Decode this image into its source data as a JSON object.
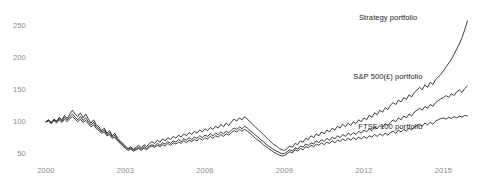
{
  "chart_data": {
    "type": "line",
    "title": "",
    "subtitle": "",
    "xlabel": "",
    "ylabel": "",
    "grid": false,
    "legend_position": "inline-right-of-series",
    "xlim": [
      1999.85,
      2016.0
    ],
    "ylim": [
      40,
      272
    ],
    "yticks": [
      50,
      100,
      150,
      200,
      250
    ],
    "ytick_labels": [
      "50",
      "100",
      "150",
      "200",
      "250"
    ],
    "xticks": [
      2000,
      2003,
      2006,
      2009,
      2012,
      2015
    ],
    "xtick_labels": [
      "2000",
      "2003",
      "2006",
      "2009",
      "2012",
      "2015"
    ],
    "line_color": "#1a1a1a",
    "tick_color": "#8a8a8a",
    "annotations": [
      {
        "name": "strategy-portfolio-label",
        "text": "Strategy portfolio",
        "x": 2014.0,
        "y": 262
      },
      {
        "name": "sp500-portfolio-label",
        "text": "S&P 500(£) portfolio",
        "x": 2014.2,
        "y": 170
      },
      {
        "name": "ftse100-portfolio-label",
        "text": "FTSE 100 portfolio",
        "x": 2014.2,
        "y": 92
      }
    ],
    "series": [
      {
        "name": "Strategy portfolio",
        "label": "Strategy portfolio",
        "final_value": 261,
        "start_value": 100,
        "x": [
          2000.0,
          2000.1,
          2000.2,
          2000.3,
          2000.4,
          2000.5,
          2000.6,
          2000.7,
          2000.8,
          2000.9,
          2001.0,
          2001.1,
          2001.2,
          2001.3,
          2001.4,
          2001.5,
          2001.6,
          2001.7,
          2001.8,
          2001.9,
          2002.0,
          2002.1,
          2002.2,
          2002.3,
          2002.4,
          2002.5,
          2002.6,
          2002.7,
          2002.8,
          2002.9,
          2003.0,
          2003.1,
          2003.2,
          2003.3,
          2003.4,
          2003.5,
          2003.6,
          2003.7,
          2003.8,
          2003.9,
          2004.0,
          2004.1,
          2004.2,
          2004.3,
          2004.4,
          2004.5,
          2004.6,
          2004.7,
          2004.8,
          2004.9,
          2005.0,
          2005.1,
          2005.2,
          2005.3,
          2005.4,
          2005.5,
          2005.6,
          2005.7,
          2005.8,
          2005.9,
          2006.0,
          2006.1,
          2006.2,
          2006.3,
          2006.4,
          2006.5,
          2006.6,
          2006.7,
          2006.8,
          2006.9,
          2007.0,
          2007.1,
          2007.2,
          2007.3,
          2007.4,
          2007.5,
          2007.6,
          2007.7,
          2007.8,
          2007.9,
          2008.0,
          2008.1,
          2008.2,
          2008.3,
          2008.4,
          2008.5,
          2008.6,
          2008.7,
          2008.8,
          2008.9,
          2009.0,
          2009.1,
          2009.2,
          2009.3,
          2009.4,
          2009.5,
          2009.6,
          2009.7,
          2009.8,
          2009.9,
          2010.0,
          2010.1,
          2010.2,
          2010.3,
          2010.4,
          2010.5,
          2010.6,
          2010.7,
          2010.8,
          2010.9,
          2011.0,
          2011.1,
          2011.2,
          2011.3,
          2011.4,
          2011.5,
          2011.6,
          2011.7,
          2011.8,
          2011.9,
          2012.0,
          2012.1,
          2012.2,
          2012.3,
          2012.4,
          2012.5,
          2012.6,
          2012.7,
          2012.8,
          2012.9,
          2013.0,
          2013.1,
          2013.2,
          2013.3,
          2013.4,
          2013.5,
          2013.6,
          2013.7,
          2013.8,
          2013.9,
          2014.0,
          2014.1,
          2014.2,
          2014.3,
          2014.4,
          2014.5,
          2014.6,
          2014.7,
          2014.8,
          2014.9,
          2015.0,
          2015.1,
          2015.2,
          2015.3,
          2015.4,
          2015.5,
          2015.6,
          2015.7,
          2015.8,
          2015.9
        ],
        "values": [
          100,
          103,
          99,
          104,
          101,
          107,
          103,
          110,
          105,
          112,
          118,
          112,
          108,
          114,
          106,
          112,
          104,
          98,
          103,
          95,
          92,
          86,
          90,
          82,
          86,
          78,
          82,
          74,
          70,
          66,
          62,
          58,
          61,
          57,
          60,
          63,
          59,
          64,
          61,
          66,
          69,
          66,
          71,
          68,
          73,
          70,
          75,
          72,
          77,
          74,
          79,
          76,
          81,
          78,
          83,
          80,
          85,
          82,
          87,
          84,
          89,
          86,
          91,
          88,
          93,
          90,
          96,
          92,
          98,
          94,
          100,
          104,
          101,
          106,
          103,
          108,
          104,
          100,
          96,
          92,
          88,
          84,
          80,
          76,
          72,
          68,
          64,
          62,
          58,
          56,
          55,
          58,
          62,
          60,
          66,
          64,
          70,
          68,
          74,
          72,
          78,
          75,
          81,
          78,
          84,
          81,
          87,
          84,
          90,
          87,
          93,
          90,
          96,
          92,
          98,
          94,
          100,
          97,
          103,
          100,
          106,
          103,
          110,
          107,
          114,
          111,
          118,
          115,
          122,
          119,
          126,
          130,
          127,
          134,
          131,
          138,
          135,
          142,
          139,
          146,
          150,
          154,
          150,
          158,
          154,
          162,
          158,
          166,
          170,
          174,
          180,
          186,
          192,
          198,
          206,
          214,
          222,
          232,
          244,
          258
        ]
      },
      {
        "name": "S&P 500(£) portfolio",
        "label": "S&P 500(£) portfolio",
        "final_value": 158,
        "start_value": 100,
        "x": [
          2000.0,
          2000.1,
          2000.2,
          2000.3,
          2000.4,
          2000.5,
          2000.6,
          2000.7,
          2000.8,
          2000.9,
          2001.0,
          2001.1,
          2001.2,
          2001.3,
          2001.4,
          2001.5,
          2001.6,
          2001.7,
          2001.8,
          2001.9,
          2002.0,
          2002.1,
          2002.2,
          2002.3,
          2002.4,
          2002.5,
          2002.6,
          2002.7,
          2002.8,
          2002.9,
          2003.0,
          2003.1,
          2003.2,
          2003.3,
          2003.4,
          2003.5,
          2003.6,
          2003.7,
          2003.8,
          2003.9,
          2004.0,
          2004.1,
          2004.2,
          2004.3,
          2004.4,
          2004.5,
          2004.6,
          2004.7,
          2004.8,
          2004.9,
          2005.0,
          2005.1,
          2005.2,
          2005.3,
          2005.4,
          2005.5,
          2005.6,
          2005.7,
          2005.8,
          2005.9,
          2006.0,
          2006.1,
          2006.2,
          2006.3,
          2006.4,
          2006.5,
          2006.6,
          2006.7,
          2006.8,
          2006.9,
          2007.0,
          2007.1,
          2007.2,
          2007.3,
          2007.4,
          2007.5,
          2007.6,
          2007.7,
          2007.8,
          2007.9,
          2008.0,
          2008.1,
          2008.2,
          2008.3,
          2008.4,
          2008.5,
          2008.6,
          2008.7,
          2008.8,
          2008.9,
          2009.0,
          2009.1,
          2009.2,
          2009.3,
          2009.4,
          2009.5,
          2009.6,
          2009.7,
          2009.8,
          2009.9,
          2010.0,
          2010.1,
          2010.2,
          2010.3,
          2010.4,
          2010.5,
          2010.6,
          2010.7,
          2010.8,
          2010.9,
          2011.0,
          2011.1,
          2011.2,
          2011.3,
          2011.4,
          2011.5,
          2011.6,
          2011.7,
          2011.8,
          2011.9,
          2012.0,
          2012.1,
          2012.2,
          2012.3,
          2012.4,
          2012.5,
          2012.6,
          2012.7,
          2012.8,
          2012.9,
          2013.0,
          2013.1,
          2013.2,
          2013.3,
          2013.4,
          2013.5,
          2013.6,
          2013.7,
          2013.8,
          2013.9,
          2014.0,
          2014.1,
          2014.2,
          2014.3,
          2014.4,
          2014.5,
          2014.6,
          2014.7,
          2014.8,
          2014.9,
          2015.0,
          2015.1,
          2015.2,
          2015.3,
          2015.4,
          2015.5,
          2015.6,
          2015.7,
          2015.8,
          2015.9
        ],
        "values": [
          100,
          102,
          98,
          103,
          100,
          105,
          101,
          107,
          103,
          108,
          112,
          107,
          103,
          108,
          102,
          106,
          100,
          95,
          99,
          92,
          89,
          84,
          87,
          80,
          83,
          76,
          79,
          72,
          68,
          64,
          60,
          57,
          59,
          56,
          58,
          60,
          57,
          61,
          58,
          62,
          64,
          62,
          66,
          63,
          67,
          65,
          69,
          66,
          70,
          68,
          72,
          69,
          73,
          71,
          75,
          72,
          76,
          74,
          78,
          75,
          79,
          77,
          81,
          78,
          82,
          80,
          84,
          81,
          85,
          83,
          87,
          90,
          88,
          92,
          89,
          93,
          90,
          86,
          83,
          79,
          76,
          72,
          69,
          65,
          62,
          59,
          56,
          54,
          52,
          50,
          50,
          53,
          56,
          54,
          59,
          57,
          62,
          60,
          65,
          63,
          67,
          65,
          70,
          67,
          72,
          69,
          74,
          71,
          76,
          73,
          78,
          75,
          80,
          77,
          82,
          79,
          83,
          80,
          85,
          82,
          87,
          84,
          89,
          86,
          92,
          89,
          94,
          91,
          97,
          94,
          99,
          103,
          100,
          106,
          103,
          109,
          106,
          112,
          109,
          115,
          118,
          121,
          118,
          124,
          121,
          127,
          124,
          130,
          133,
          136,
          138,
          141,
          138,
          144,
          141,
          147,
          150,
          146,
          152,
          156
        ]
      },
      {
        "name": "FTSE 100 portfolio",
        "label": "FTSE 100 portfolio",
        "final_value": 110,
        "start_value": 100,
        "x": [
          2000.0,
          2000.1,
          2000.2,
          2000.3,
          2000.4,
          2000.5,
          2000.6,
          2000.7,
          2000.8,
          2000.9,
          2001.0,
          2001.1,
          2001.2,
          2001.3,
          2001.4,
          2001.5,
          2001.6,
          2001.7,
          2001.8,
          2001.9,
          2002.0,
          2002.1,
          2002.2,
          2002.3,
          2002.4,
          2002.5,
          2002.6,
          2002.7,
          2002.8,
          2002.9,
          2003.0,
          2003.1,
          2003.2,
          2003.3,
          2003.4,
          2003.5,
          2003.6,
          2003.7,
          2003.8,
          2003.9,
          2004.0,
          2004.1,
          2004.2,
          2004.3,
          2004.4,
          2004.5,
          2004.6,
          2004.7,
          2004.8,
          2004.9,
          2005.0,
          2005.1,
          2005.2,
          2005.3,
          2005.4,
          2005.5,
          2005.6,
          2005.7,
          2005.8,
          2005.9,
          2006.0,
          2006.1,
          2006.2,
          2006.3,
          2006.4,
          2006.5,
          2006.6,
          2006.7,
          2006.8,
          2006.9,
          2007.0,
          2007.1,
          2007.2,
          2007.3,
          2007.4,
          2007.5,
          2007.6,
          2007.7,
          2007.8,
          2007.9,
          2008.0,
          2008.1,
          2008.2,
          2008.3,
          2008.4,
          2008.5,
          2008.6,
          2008.7,
          2008.8,
          2008.9,
          2009.0,
          2009.1,
          2009.2,
          2009.3,
          2009.4,
          2009.5,
          2009.6,
          2009.7,
          2009.8,
          2009.9,
          2010.0,
          2010.1,
          2010.2,
          2010.3,
          2010.4,
          2010.5,
          2010.6,
          2010.7,
          2010.8,
          2010.9,
          2011.0,
          2011.1,
          2011.2,
          2011.3,
          2011.4,
          2011.5,
          2011.6,
          2011.7,
          2011.8,
          2011.9,
          2012.0,
          2012.1,
          2012.2,
          2012.3,
          2012.4,
          2012.5,
          2012.6,
          2012.7,
          2012.8,
          2012.9,
          2013.0,
          2013.1,
          2013.2,
          2013.3,
          2013.4,
          2013.5,
          2013.6,
          2013.7,
          2013.8,
          2013.9,
          2014.0,
          2014.1,
          2014.2,
          2014.3,
          2014.4,
          2014.5,
          2014.6,
          2014.7,
          2014.8,
          2014.9,
          2015.0,
          2015.1,
          2015.2,
          2015.3,
          2015.4,
          2015.5,
          2015.6,
          2015.7,
          2015.8,
          2015.9
        ],
        "values": [
          100,
          101,
          97,
          102,
          98,
          103,
          99,
          104,
          100,
          105,
          108,
          104,
          100,
          104,
          99,
          102,
          97,
          92,
          95,
          89,
          86,
          82,
          84,
          78,
          80,
          74,
          76,
          70,
          66,
          62,
          58,
          55,
          57,
          54,
          56,
          58,
          55,
          59,
          56,
          60,
          62,
          60,
          63,
          61,
          64,
          62,
          66,
          63,
          67,
          65,
          68,
          66,
          70,
          67,
          71,
          69,
          72,
          70,
          74,
          71,
          75,
          73,
          77,
          74,
          78,
          76,
          80,
          77,
          81,
          79,
          83,
          86,
          84,
          88,
          85,
          88,
          85,
          82,
          78,
          74,
          71,
          68,
          64,
          61,
          58,
          55,
          52,
          50,
          48,
          46,
          47,
          50,
          53,
          51,
          56,
          54,
          58,
          56,
          61,
          59,
          63,
          61,
          65,
          63,
          67,
          64,
          68,
          66,
          70,
          67,
          71,
          69,
          73,
          70,
          74,
          71,
          75,
          72,
          76,
          73,
          77,
          74,
          78,
          76,
          80,
          77,
          81,
          78,
          82,
          79,
          83,
          85,
          82,
          87,
          84,
          88,
          85,
          90,
          87,
          92,
          94,
          96,
          93,
          98,
          95,
          99,
          96,
          101,
          103,
          105,
          106,
          104,
          107,
          105,
          108,
          106,
          109,
          107,
          110,
          109
        ]
      }
    ]
  }
}
